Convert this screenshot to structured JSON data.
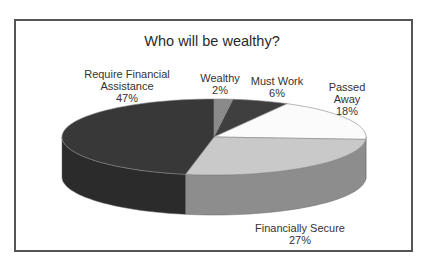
{
  "chart_data": {
    "type": "pie",
    "style": "3d",
    "title": "Who will be wealthy?",
    "categories": [
      "Wealthy",
      "Must Work",
      "Passed Away",
      "Financially Secure",
      "Require Financial Assistance"
    ],
    "values": [
      2,
      6,
      18,
      27,
      47
    ],
    "unit": "%",
    "colors": {
      "Wealthy": "#8a8a8a",
      "Must Work": "#3f3f3f",
      "Passed Away": "#fbfbfb",
      "Financially Secure": "#c9c9c9",
      "Require Financial Assistance": "#383838"
    },
    "legend": "none (data labels on slices)"
  },
  "labels": {
    "wealthy": {
      "name": "Wealthy",
      "pct": "2%"
    },
    "must_work": {
      "name": "Must Work",
      "pct": "6%"
    },
    "passed_away": {
      "line1": "Passed",
      "line2": "Away",
      "pct": "18%"
    },
    "financially_secure": {
      "name": "Financially Secure",
      "pct": "27%"
    },
    "require_assistance": {
      "line1": "Require Financial",
      "line2": "Assistance",
      "pct": "47%"
    }
  }
}
